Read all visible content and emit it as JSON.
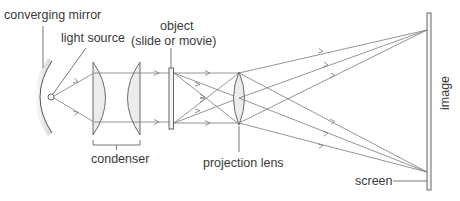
{
  "diagram": {
    "labels": {
      "mirror": "converging mirror",
      "light_source": "light source",
      "object_line1": "object",
      "object_line2": "(slide or movie)",
      "condenser": "condenser",
      "projection_lens": "projection lens",
      "screen": "screen",
      "image": "image"
    },
    "colors": {
      "line": "#6a6a6a",
      "ray": "#7a7a7a",
      "lens_fill": "#ececec",
      "mirror_shade": "#d8d8d8",
      "text": "#3a3a3a"
    }
  }
}
